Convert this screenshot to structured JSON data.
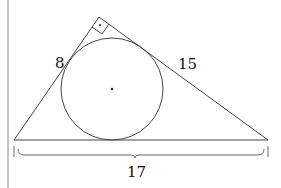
{
  "diagram": {
    "type": "right triangle with inscribed circle",
    "labels": {
      "left_leg": "8",
      "right_leg": "15",
      "hypotenuse": "17"
    },
    "vertices": {
      "apex": [
        99,
        17
      ],
      "bottom_left": [
        14,
        140
      ],
      "bottom_right": [
        268,
        140
      ]
    },
    "incircle": {
      "cx": 112,
      "cy": 89,
      "r": 51
    },
    "colors": {
      "stroke": "#444444",
      "text": "#111111",
      "border": "#888888"
    }
  }
}
